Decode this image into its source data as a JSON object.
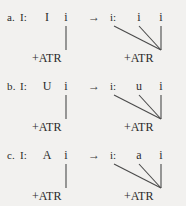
{
  "figure": {
    "background_color": "#f2f1ef",
    "text_color": "#2b2b2b",
    "line_color": "#4a4a4a",
    "arrow_glyph": "→"
  },
  "rows": [
    {
      "letter": "a.",
      "input": {
        "tier_label": "I:",
        "slots": [
          "I",
          "i"
        ],
        "feature": "+ATR",
        "associations": [
          1
        ]
      },
      "output": {
        "tier_label": "i:",
        "slots": [
          "i",
          "i"
        ],
        "feature": "+ATR",
        "associations": [
          "tier",
          0,
          1
        ]
      }
    },
    {
      "letter": "b.",
      "input": {
        "tier_label": "I:",
        "slots": [
          "U",
          "i"
        ],
        "feature": "+ATR",
        "associations": [
          1
        ]
      },
      "output": {
        "tier_label": "i:",
        "slots": [
          "u",
          "i"
        ],
        "feature": "+ATR",
        "associations": [
          "tier",
          0,
          1
        ]
      }
    },
    {
      "letter": "c.",
      "input": {
        "tier_label": "I:",
        "slots": [
          "A",
          "i"
        ],
        "feature": "+ATR",
        "associations": [
          1
        ]
      },
      "output": {
        "tier_label": "i:",
        "slots": [
          "a",
          "i"
        ],
        "feature": "+ATR",
        "associations": [
          "tier",
          0,
          1
        ]
      }
    }
  ]
}
